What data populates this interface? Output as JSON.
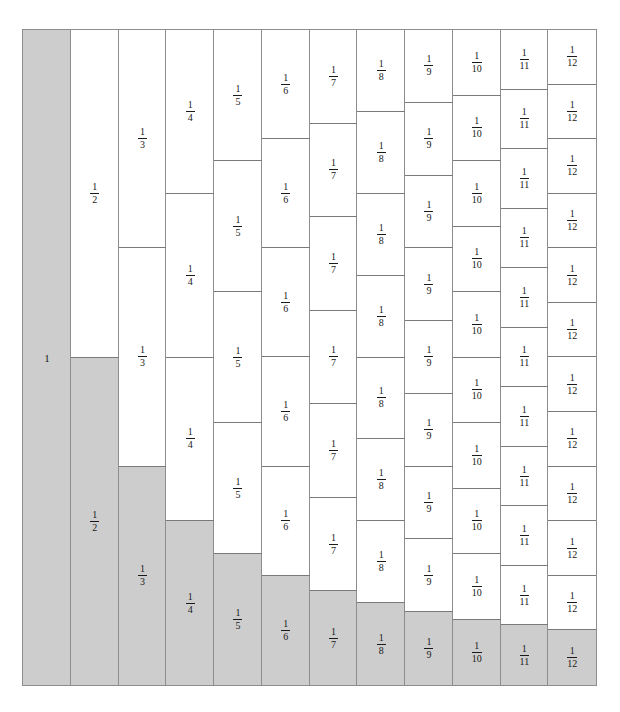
{
  "figure": {
    "columns_count": 12,
    "shade_color": "#cdcdcd",
    "cell_border_color": "#7a7a7a",
    "frame_color": "#8d8d8d",
    "background_color": "#ffffff",
    "text_color": "#1a1a1a"
  },
  "chart_data": {
    "type": "bar",
    "xlabel": "",
    "ylabel": "",
    "grid": false,
    "legend": null,
    "categories": [
      "1",
      "2",
      "3",
      "4",
      "5",
      "6",
      "7",
      "8",
      "9",
      "10",
      "11",
      "12"
    ],
    "values": [
      1,
      0.5,
      0.3333333333,
      0.25,
      0.2,
      0.1666666667,
      0.1428571429,
      0.125,
      0.1111111111,
      0.1,
      0.0909090909,
      0.0833333333
    ],
    "ylim": [
      0,
      1
    ],
    "columns": [
      {
        "n": 1,
        "label": "1",
        "numerator": "1",
        "denominator": "1",
        "cells": 1,
        "cell_fraction": 1,
        "shaded_fraction": 1
      },
      {
        "n": 2,
        "label": "1/2",
        "numerator": "1",
        "denominator": "2",
        "cells": 2,
        "cell_fraction": 0.5,
        "shaded_fraction": 0.5
      },
      {
        "n": 3,
        "label": "1/3",
        "numerator": "1",
        "denominator": "3",
        "cells": 3,
        "cell_fraction": 0.3333333333,
        "shaded_fraction": 0.3333333333
      },
      {
        "n": 4,
        "label": "1/4",
        "numerator": "1",
        "denominator": "4",
        "cells": 4,
        "cell_fraction": 0.25,
        "shaded_fraction": 0.25
      },
      {
        "n": 5,
        "label": "1/5",
        "numerator": "1",
        "denominator": "5",
        "cells": 5,
        "cell_fraction": 0.2,
        "shaded_fraction": 0.2
      },
      {
        "n": 6,
        "label": "1/6",
        "numerator": "1",
        "denominator": "6",
        "cells": 6,
        "cell_fraction": 0.1666666667,
        "shaded_fraction": 0.1666666667
      },
      {
        "n": 7,
        "label": "1/7",
        "numerator": "1",
        "denominator": "7",
        "cells": 7,
        "cell_fraction": 0.1428571429,
        "shaded_fraction": 0.1428571429
      },
      {
        "n": 8,
        "label": "1/8",
        "numerator": "1",
        "denominator": "8",
        "cells": 8,
        "cell_fraction": 0.125,
        "shaded_fraction": 0.125
      },
      {
        "n": 9,
        "label": "1/9",
        "numerator": "1",
        "denominator": "9",
        "cells": 9,
        "cell_fraction": 0.1111111111,
        "shaded_fraction": 0.1111111111
      },
      {
        "n": 10,
        "label": "1/10",
        "numerator": "1",
        "denominator": "10",
        "cells": 10,
        "cell_fraction": 0.1,
        "shaded_fraction": 0.1
      },
      {
        "n": 11,
        "label": "1/11",
        "numerator": "1",
        "denominator": "11",
        "cells": 11,
        "cell_fraction": 0.0909090909,
        "shaded_fraction": 0.0909090909
      },
      {
        "n": 12,
        "label": "1/12",
        "numerator": "1",
        "denominator": "12",
        "cells": 12,
        "cell_fraction": 0.0833333333,
        "shaded_fraction": 0.0833333333
      }
    ]
  }
}
